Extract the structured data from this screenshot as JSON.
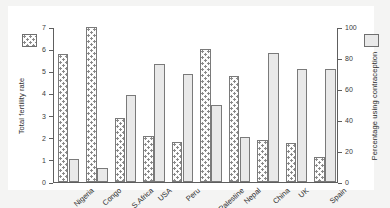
{
  "chart_data": {
    "type": "bar",
    "title": "",
    "subtitle": "",
    "categories": [
      "Nigeria",
      "Congo",
      "S.Africa",
      "USA",
      "Peru",
      "Palestine",
      "Nepal",
      "China",
      "UK",
      "Spain"
    ],
    "series": [
      {
        "name": "Total fertility rate",
        "axis": "left",
        "pattern": "dotted",
        "values": [
          5.8,
          7.0,
          2.9,
          2.1,
          1.8,
          6.0,
          4.8,
          1.9,
          1.75,
          1.15
        ]
      },
      {
        "name": "Percentage using contraception",
        "axis": "right",
        "pattern": "solid",
        "values": [
          15,
          9,
          56,
          76,
          70,
          50,
          29,
          83,
          73,
          73
        ]
      }
    ],
    "ylabel": "Total fertility rate",
    "ylabel_right": "Percentage using contraception",
    "xlabel": "",
    "ylim": [
      0,
      7
    ],
    "ylim_right": [
      0,
      100
    ],
    "yticks": [
      0,
      1,
      2,
      3,
      4,
      5,
      6,
      7
    ],
    "yticks_right": [
      0,
      20,
      40,
      60,
      80,
      100
    ],
    "grid": false,
    "legend_position": "outside-top-corners"
  },
  "axes": {
    "left_title": "Total fertility rate",
    "right_title": "Percentage using contraception",
    "left_ticks": [
      "0",
      "1",
      "2",
      "3",
      "4",
      "5",
      "6",
      "7"
    ],
    "right_ticks": [
      "0",
      "20",
      "40",
      "60",
      "80",
      "100"
    ]
  },
  "legend": {
    "fertility_swatch": "dotted-square-swatch",
    "contraception_swatch": "solid-gray-square-swatch"
  },
  "colors": {
    "background": "#f4f4f3",
    "panel": "#ffffff",
    "axis": "#5e5e5e",
    "bar_outline": "#7a7a7a",
    "bar_fill_dotted": "#fdfdfd",
    "bar_fill_solid": "#e9e9e9",
    "text": "#2d2d2d"
  }
}
